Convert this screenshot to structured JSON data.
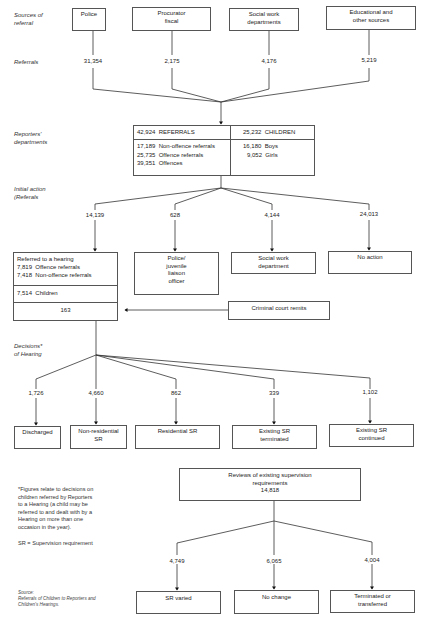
{
  "row_labels": {
    "sources": [
      "Sources of",
      "referral"
    ],
    "referrals": "Referrals",
    "reporters": [
      "Reporters'",
      "departments"
    ],
    "initial_action": [
      "Initial action",
      "(Referals"
    ],
    "decisions": [
      "Decisions*",
      "of Hearing"
    ]
  },
  "sources": [
    {
      "label": [
        "Police"
      ],
      "value": "31,354"
    },
    {
      "label": [
        "Procurator",
        "fiscal"
      ],
      "value": "2,175"
    },
    {
      "label": [
        "Social work",
        "departments"
      ],
      "value": "4,176"
    },
    {
      "label": [
        "Educational and",
        "other sources"
      ],
      "value": "5,219"
    }
  ],
  "reporters_box": {
    "referrals_total": "42,924",
    "referrals_label": "REFERRALS",
    "children_total": "25,232",
    "children_label": "CHILDREN",
    "breakdown": [
      {
        "value": "17,189",
        "label": "Non-offence referrals"
      },
      {
        "value": "25,735",
        "label": "Offence referrals"
      },
      {
        "value": "39,351",
        "label": "Offences"
      }
    ],
    "children_breakdown": [
      {
        "value": "16,180",
        "label": "Boys"
      },
      {
        "value": "9,052",
        "label": "Girls"
      }
    ]
  },
  "initial_actions": [
    {
      "value": "14,139"
    },
    {
      "value": "628",
      "label": [
        "Police/",
        "juvenile",
        "liaison",
        "officer"
      ]
    },
    {
      "value": "4,144",
      "label": [
        "Social work",
        "department"
      ]
    },
    {
      "value": "24,013",
      "label": [
        "No action"
      ]
    }
  ],
  "hearing_box": {
    "title": "Referred to a hearing",
    "rows": [
      {
        "value": "7,819",
        "label": "Offence referrals"
      },
      {
        "value": "7,418",
        "label": "Non-offence referrals"
      }
    ],
    "children_value": "7,514",
    "children_label": "Children",
    "remits_value": "163"
  },
  "criminal_court_remits": "Criminal court remits",
  "decisions": [
    {
      "value": "1,726",
      "label": [
        "Discharged"
      ]
    },
    {
      "value": "4,660",
      "label": [
        "Non-residential",
        "SR"
      ]
    },
    {
      "value": "862",
      "label": [
        "Residential SR"
      ]
    },
    {
      "value": "339",
      "label": [
        "Existing SR",
        "terminated"
      ]
    },
    {
      "value": "1,102",
      "label": [
        "Existing SR",
        "continued"
      ]
    }
  ],
  "reviews_box": {
    "label": [
      "Reviews of existing supervision",
      "requirements"
    ],
    "value": "14,818"
  },
  "review_outcomes": [
    {
      "value": "4,749",
      "label": [
        "SR varied"
      ]
    },
    {
      "value": "6,065",
      "label": [
        "No change"
      ]
    },
    {
      "value": "4,004",
      "label": [
        "Terminated or",
        "transferred"
      ]
    }
  ],
  "footnote": [
    "*Figures relate to decisions on",
    "children referred by Reporters",
    "to a Hearing (a child may be",
    "referred to and dealt with by a",
    "Hearing on more than one",
    "occasion in the year)."
  ],
  "sr_definition": "SR = Supervision requirement",
  "source": {
    "heading": "Source:",
    "lines": [
      "Referrals of Children to Reporters and",
      "Children's Hearings."
    ]
  }
}
